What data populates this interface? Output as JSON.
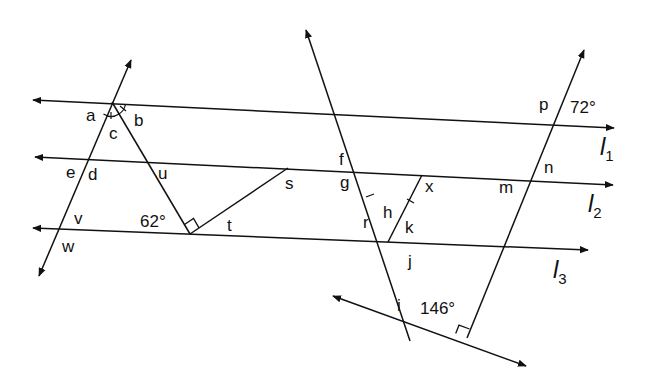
{
  "diagram": {
    "type": "geometry-parallel-lines-transversals",
    "colors": {
      "stroke": "#111111",
      "background": "#ffffff"
    },
    "parallel_lines": [
      {
        "id": "l1",
        "name": "l",
        "subscript": "1"
      },
      {
        "id": "l2",
        "name": "l",
        "subscript": "2"
      },
      {
        "id": "l3",
        "name": "l",
        "subscript": "3"
      }
    ],
    "given_angles": {
      "angle_62": "62°",
      "angle_72": "72°",
      "angle_146": "146°"
    },
    "angle_labels": {
      "a": "a",
      "b": "b",
      "c": "c",
      "d": "d",
      "e": "e",
      "f": "f",
      "g": "g",
      "h": "h",
      "i": "i",
      "j": "j",
      "k": "k",
      "m": "m",
      "n": "n",
      "p": "p",
      "r": "r",
      "s": "s",
      "t": "t",
      "u": "u",
      "v": "v",
      "w": "w",
      "x": "x"
    },
    "markers": {
      "right_angles": [
        "triangle-vertex-t",
        "bottom-line-right-transversal"
      ],
      "congruent_arcs": [
        "angle-a-c-b at top-left vertex"
      ],
      "congruent_ticks": [
        "segment-r",
        "segment-k"
      ]
    }
  }
}
